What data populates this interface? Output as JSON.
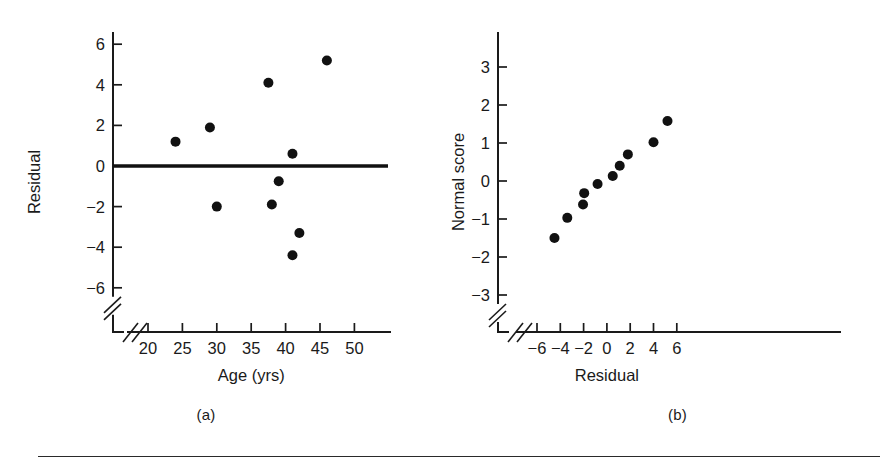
{
  "figure": {
    "background_color": "#ffffff",
    "ink_color": "#111111",
    "panels": [
      {
        "id": "a",
        "caption": "(a)",
        "chart_ref": 0
      },
      {
        "id": "b",
        "caption": "(b)",
        "chart_ref": 1
      }
    ],
    "footer_rule": true
  },
  "chart_data": [
    {
      "type": "scatter",
      "title": "",
      "xlabel": "Age (yrs)",
      "ylabel": "Residual",
      "xlim": [
        17.5,
        52
      ],
      "ylim": [
        -7.2,
        7.0
      ],
      "xticks": [
        20,
        25,
        30,
        35,
        40,
        45,
        50
      ],
      "xticklabels": [
        "20",
        "25",
        "30",
        "35",
        "40",
        "45",
        "50"
      ],
      "yticks": [
        6,
        4,
        2,
        0,
        -2,
        -4,
        -6
      ],
      "yticklabels": [
        "6",
        "4",
        "2",
        "0",
        "−2",
        "−4",
        "−6"
      ],
      "grid": false,
      "legend": false,
      "axis_break_x": true,
      "axis_break_y": true,
      "reference_line": {
        "orientation": "horizontal",
        "y": 0,
        "label": "zero-residual-line"
      },
      "x": [
        24.0,
        29.0,
        30.0,
        37.5,
        38.0,
        39.0,
        41.0,
        41.0,
        41.5,
        42.0,
        46.0
      ],
      "y": [
        1.2,
        1.9,
        -2.0,
        4.1,
        -1.9,
        -0.75,
        0.6,
        -4.4,
        -4.4,
        -3.3,
        5.2
      ],
      "points": [
        {
          "x": 24.0,
          "y": 1.2
        },
        {
          "x": 29.0,
          "y": 1.9
        },
        {
          "x": 30.0,
          "y": -2.0
        },
        {
          "x": 37.5,
          "y": 4.1
        },
        {
          "x": 38.0,
          "y": -1.9
        },
        {
          "x": 39.0,
          "y": -0.75
        },
        {
          "x": 41.0,
          "y": 0.6
        },
        {
          "x": 41.0,
          "y": -4.4
        },
        {
          "x": 42.0,
          "y": -3.3
        },
        {
          "x": 46.0,
          "y": 5.2
        }
      ]
    },
    {
      "type": "scatter",
      "title": "",
      "xlabel": "Residual",
      "ylabel": "Normal score",
      "xlim": [
        -7.6,
        7.6
      ],
      "ylim": [
        -3.9,
        3.9
      ],
      "xticks": [
        -6,
        -4,
        -2,
        0,
        2,
        4,
        6
      ],
      "xticklabels": [
        "−6",
        "−4",
        "−2",
        "0",
        "2",
        "4",
        "6"
      ],
      "yticks": [
        3,
        2,
        1,
        0,
        -1,
        -2,
        -3
      ],
      "yticklabels": [
        "3",
        "2",
        "1",
        "0",
        "−1",
        "−2",
        "−3"
      ],
      "grid": false,
      "legend": false,
      "axis_break_x": true,
      "axis_break_y": true,
      "x": [
        -4.5,
        -3.4,
        -2.0,
        -2.0,
        -0.8,
        0.5,
        1.1,
        1.8,
        4.0,
        5.2
      ],
      "y": [
        -1.5,
        -0.97,
        -0.32,
        -0.62,
        -0.08,
        0.13,
        0.4,
        0.7,
        1.02,
        1.58
      ],
      "points": [
        {
          "x": -4.5,
          "y": -1.5
        },
        {
          "x": -3.4,
          "y": -0.97
        },
        {
          "x": -2.05,
          "y": -0.62
        },
        {
          "x": -1.95,
          "y": -0.32
        },
        {
          "x": -0.8,
          "y": -0.08
        },
        {
          "x": 0.5,
          "y": 0.13
        },
        {
          "x": 1.1,
          "y": 0.4
        },
        {
          "x": 1.8,
          "y": 0.7
        },
        {
          "x": 4.0,
          "y": 1.02
        },
        {
          "x": 5.2,
          "y": 1.58
        }
      ]
    }
  ]
}
